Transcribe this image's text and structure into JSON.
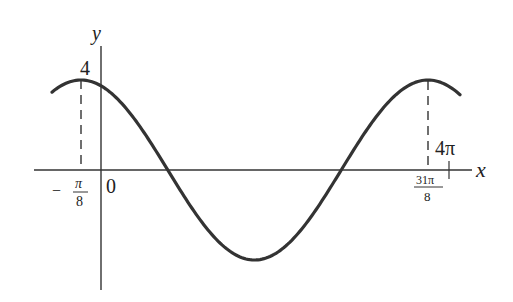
{
  "chart_data": {
    "type": "line",
    "title": "",
    "function": "y = 4 cos((x + pi/8)/2)",
    "xlabel": "x",
    "ylabel": "y",
    "amplitude": 4,
    "period": "4π",
    "x_ticks": [
      {
        "value": -0.3927,
        "label_num": "π",
        "label_den": "8",
        "label_sign": "−"
      },
      {
        "value": 0,
        "label": "0"
      },
      {
        "value": 12.1737,
        "label_num": "31π",
        "label_den": "8"
      },
      {
        "value": 12.5664,
        "label": "4π"
      }
    ],
    "y_ticks": [
      {
        "value": 4,
        "label": "4"
      }
    ],
    "key_points": [
      {
        "x": "−π/8",
        "y": 4,
        "note": "maximum"
      },
      {
        "x": "7π/8",
        "y": 0,
        "note": "zero"
      },
      {
        "x": "15π/8",
        "y": -4,
        "note": "minimum"
      },
      {
        "x": "23π/8",
        "y": 0,
        "note": "zero"
      },
      {
        "x": "31π/8",
        "y": 4,
        "note": "maximum"
      }
    ],
    "series": [
      {
        "name": "curve",
        "color": "#333333"
      }
    ],
    "grid": false,
    "legend": null
  },
  "labels": {
    "y_axis": "y",
    "x_axis": "x",
    "y_max": "4",
    "origin": "0",
    "neg_pi_8_sign": "−",
    "neg_pi_8_num": "π",
    "neg_pi_8_den": "8",
    "right_num": "31π",
    "right_den": "8",
    "four_pi": "4π"
  }
}
